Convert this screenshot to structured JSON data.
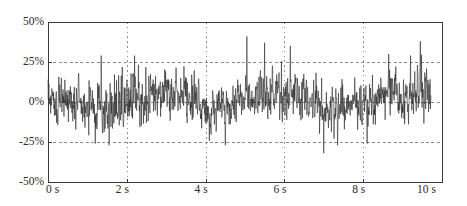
{
  "chart_data": {
    "type": "line",
    "title": "",
    "subtitle": "",
    "xlabel": "",
    "ylabel": "",
    "xlim": [
      0,
      10
    ],
    "ylim": [
      -50,
      50
    ],
    "grid": true,
    "legend": null,
    "x_unit": "s",
    "y_unit": "%",
    "x_ticks": [
      0,
      2,
      4,
      6,
      8,
      10
    ],
    "x_tick_labels": [
      "0 s",
      "2 s",
      "4 s",
      "6 s",
      "8 s",
      "10 s"
    ],
    "y_ticks": [
      50,
      25,
      0,
      -25,
      -50
    ],
    "y_tick_labels": [
      "50%",
      "25%",
      "0%",
      "-25%",
      "-50%"
    ],
    "series": [
      {
        "name": "noise-signal",
        "color": "#2a2a2a",
        "line_width": 0.6,
        "sample_rate_hz": 100,
        "x_start": 0.0,
        "x_end": 9.72,
        "description": "Dense random noise trace, mean near 0%, typical envelope about -25% to +25%, occasional spikes to +40% and -32%.",
        "envelope_segments": [
          {
            "t_start": 0.0,
            "t_end": 0.6,
            "mean": 3,
            "sigma": 9
          },
          {
            "t_start": 0.6,
            "t_end": 1.2,
            "mean": -3,
            "sigma": 11
          },
          {
            "t_start": 1.2,
            "t_end": 2.0,
            "mean": -4,
            "sigma": 12
          },
          {
            "t_start": 2.0,
            "t_end": 2.6,
            "mean": 4,
            "sigma": 11
          },
          {
            "t_start": 2.6,
            "t_end": 3.5,
            "mean": 6,
            "sigma": 9
          },
          {
            "t_start": 3.5,
            "t_end": 4.0,
            "mean": 2,
            "sigma": 10
          },
          {
            "t_start": 4.0,
            "t_end": 4.6,
            "mean": -6,
            "sigma": 9
          },
          {
            "t_start": 4.6,
            "t_end": 5.2,
            "mean": 1,
            "sigma": 9
          },
          {
            "t_start": 5.2,
            "t_end": 6.0,
            "mean": 5,
            "sigma": 11
          },
          {
            "t_start": 6.0,
            "t_end": 6.6,
            "mean": 4,
            "sigma": 10
          },
          {
            "t_start": 6.6,
            "t_end": 7.4,
            "mean": -4,
            "sigma": 10
          },
          {
            "t_start": 7.4,
            "t_end": 8.0,
            "mean": -3,
            "sigma": 9
          },
          {
            "t_start": 8.0,
            "t_end": 8.8,
            "mean": 3,
            "sigma": 9
          },
          {
            "t_start": 8.8,
            "t_end": 9.72,
            "mean": 5,
            "sigma": 10
          }
        ],
        "notable_peaks": [
          {
            "t": 5.05,
            "value": 41
          },
          {
            "t": 5.5,
            "value": 37
          },
          {
            "t": 6.15,
            "value": 35
          },
          {
            "t": 9.45,
            "value": 38
          },
          {
            "t": 1.35,
            "value": 29
          },
          {
            "t": 2.2,
            "value": 29
          },
          {
            "t": 8.65,
            "value": 30
          },
          {
            "t": 9.2,
            "value": 29
          },
          {
            "t": 7.0,
            "value": -32
          },
          {
            "t": 1.55,
            "value": -27
          },
          {
            "t": 1.2,
            "value": -26
          },
          {
            "t": 4.5,
            "value": -27
          },
          {
            "t": 7.35,
            "value": -27
          },
          {
            "t": 8.1,
            "value": -26
          }
        ]
      }
    ],
    "colors": {
      "axis": "#3a3a3a",
      "grid": "#808080",
      "trace": "#2a2a2a",
      "background": "#ffffff",
      "text": "#2b2b2b"
    },
    "geometry": {
      "plot_left": 48,
      "plot_right": 442,
      "plot_top": 22,
      "plot_bottom": 182
    }
  }
}
